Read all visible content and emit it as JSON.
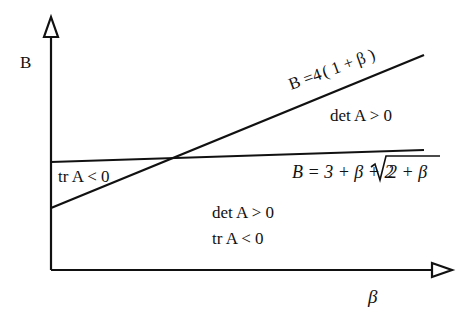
{
  "diagram": {
    "y_axis_label": "B",
    "x_axis_label": "β",
    "line_steep": {
      "label_prefix": "B =4",
      "label_paren": "( 1 + β )",
      "equation": "B = 4(1+β)"
    },
    "line_flat": {
      "label_prefix": "B = 3 + β + 2",
      "label_radicand": "2 + β",
      "equation": "B = 3 + β + 2√(2+β)"
    },
    "regions": {
      "upper_right": "det A > 0",
      "left_wedge": "tr A < 0",
      "lower_line1": "det A > 0",
      "lower_line2": "tr A < 0"
    },
    "colors": {
      "stroke": "#111111",
      "background": "#ffffff"
    }
  }
}
